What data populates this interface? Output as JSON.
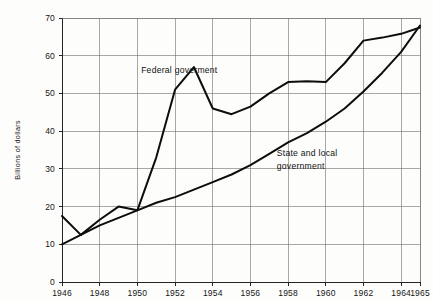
{
  "chart_data": {
    "type": "line",
    "title": "",
    "xlabel": "",
    "ylabel": "Billions of dollars",
    "xlim": [
      1946,
      1965
    ],
    "ylim": [
      0,
      70
    ],
    "grid": true,
    "legend_position": "inline-annotations",
    "x_tick_labels": [
      "1946",
      "1948",
      "1950",
      "1952",
      "1954",
      "1956",
      "1958",
      "1960",
      "1962",
      "1964",
      "1965"
    ],
    "x_tick_values": [
      1946,
      1948,
      1950,
      1952,
      1954,
      1956,
      1958,
      1960,
      1962,
      1964,
      1965
    ],
    "y_tick_labels": [
      "0",
      "10",
      "20",
      "30",
      "40",
      "50",
      "60",
      "70"
    ],
    "y_tick_values": [
      0,
      10,
      20,
      30,
      40,
      50,
      60,
      70
    ],
    "x": [
      1946,
      1947,
      1948,
      1949,
      1950,
      1951,
      1952,
      1953,
      1954,
      1955,
      1956,
      1957,
      1958,
      1959,
      1960,
      1961,
      1962,
      1963,
      1964,
      1965
    ],
    "series": [
      {
        "name": "Federal goverment",
        "label_line1": "Federal goverment",
        "label_line2": "",
        "values": [
          17.5,
          12.5,
          16.5,
          20.0,
          19.0,
          33.0,
          51.0,
          57.0,
          46.0,
          44.5,
          46.5,
          50.0,
          53.0,
          53.2,
          53.0,
          58.0,
          64.0,
          64.8,
          65.8,
          67.5
        ]
      },
      {
        "name": "State and local government",
        "label_line1": "State and local",
        "label_line2": "government",
        "values": [
          10.0,
          12.5,
          15.0,
          17.0,
          19.0,
          21.0,
          22.5,
          24.5,
          26.5,
          28.5,
          31.0,
          34.0,
          37.0,
          39.5,
          42.5,
          46.0,
          50.5,
          55.5,
          61.0,
          68.0
        ]
      }
    ],
    "annotations": [
      {
        "text": "Federal goverment",
        "x": 1950.2,
        "y": 55.5
      },
      {
        "text": "State and local",
        "x": 1957.4,
        "y": 33.5
      },
      {
        "text": "government",
        "x": 1957.4,
        "y": 30.0
      }
    ]
  }
}
